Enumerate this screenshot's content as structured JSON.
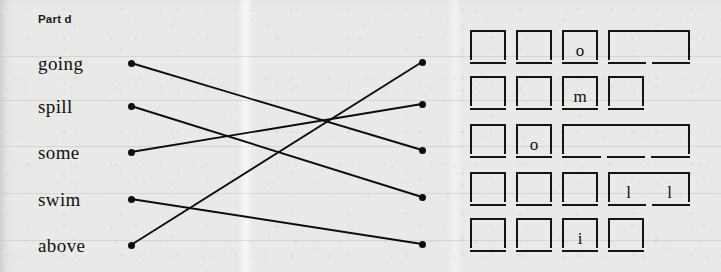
{
  "heading": {
    "label": "Part d"
  },
  "words": [
    {
      "id": "w1",
      "text": "going",
      "top": 53,
      "dot_y": 63
    },
    {
      "id": "w2",
      "text": "spill",
      "top": 96,
      "dot_y": 106
    },
    {
      "id": "w3",
      "text": "some",
      "top": 142,
      "dot_y": 152
    },
    {
      "id": "w4",
      "text": "swim",
      "top": 189,
      "dot_y": 199
    },
    {
      "id": "w5",
      "text": "above",
      "top": 235,
      "dot_y": 245
    }
  ],
  "left_dot_x": 128,
  "right_dot_x": 419,
  "right_dots": [
    {
      "id": "r1",
      "dot_y": 62
    },
    {
      "id": "r2",
      "dot_y": 104
    },
    {
      "id": "r3",
      "dot_y": 150
    },
    {
      "id": "r4",
      "dot_y": 197
    },
    {
      "id": "r5",
      "dot_y": 244
    }
  ],
  "connections": [
    {
      "from": "going",
      "to_slot": 3,
      "x1": 131,
      "y1": 63,
      "x2": 422,
      "y2": 150
    },
    {
      "from": "spill",
      "to_slot": 4,
      "x1": 131,
      "y1": 106,
      "x2": 422,
      "y2": 197
    },
    {
      "from": "some",
      "to_slot": 2,
      "x1": 131,
      "y1": 152,
      "x2": 422,
      "y2": 104
    },
    {
      "from": "swim",
      "to_slot": 5,
      "x1": 131,
      "y1": 199,
      "x2": 422,
      "y2": 244
    },
    {
      "from": "above",
      "to_slot": 1,
      "x1": 131,
      "y1": 245,
      "x2": 422,
      "y2": 62
    }
  ],
  "answer_grid": {
    "rows": [
      {
        "id": "row1",
        "top": 0,
        "cells": [
          {
            "left": 0,
            "width": 36,
            "letter": "",
            "segments": 1
          },
          {
            "left": 46,
            "width": 36,
            "letter": "",
            "segments": 1
          },
          {
            "left": 92,
            "width": 36,
            "letter": "o",
            "segments": 1
          },
          {
            "left": 138,
            "width": 82,
            "letter": "",
            "segments": 2
          }
        ]
      },
      {
        "id": "row2",
        "top": 46,
        "cells": [
          {
            "left": 0,
            "width": 36,
            "letter": "",
            "segments": 1
          },
          {
            "left": 46,
            "width": 36,
            "letter": "",
            "segments": 1
          },
          {
            "left": 92,
            "width": 36,
            "letter": "m",
            "segments": 1
          },
          {
            "left": 138,
            "width": 36,
            "letter": "",
            "segments": 1
          }
        ]
      },
      {
        "id": "row3",
        "top": 94,
        "cells": [
          {
            "left": 0,
            "width": 36,
            "letter": "",
            "segments": 1
          },
          {
            "left": 46,
            "width": 36,
            "letter": "o",
            "segments": 1
          },
          {
            "left": 92,
            "width": 128,
            "letter": "",
            "segments": 3
          }
        ]
      },
      {
        "id": "row4",
        "top": 142,
        "cells": [
          {
            "left": 0,
            "width": 36,
            "letter": "",
            "segments": 1
          },
          {
            "left": 46,
            "width": 36,
            "letter": "",
            "segments": 1
          },
          {
            "left": 92,
            "width": 36,
            "letter": "",
            "segments": 1
          },
          {
            "left": 138,
            "width": 82,
            "letter": "l l",
            "segments": 2
          }
        ]
      },
      {
        "id": "row5",
        "top": 188,
        "cells": [
          {
            "left": 0,
            "width": 36,
            "letter": "",
            "segments": 1
          },
          {
            "left": 46,
            "width": 36,
            "letter": "",
            "segments": 1
          },
          {
            "left": 92,
            "width": 36,
            "letter": "i",
            "segments": 1
          },
          {
            "left": 138,
            "width": 36,
            "letter": "",
            "segments": 1
          }
        ]
      }
    ]
  },
  "ghost_rules_y": [
    56,
    100,
    146,
    193,
    240
  ],
  "colors": {
    "paper": "#e9e9e7",
    "ink": "#111111",
    "rule": "#141414"
  }
}
